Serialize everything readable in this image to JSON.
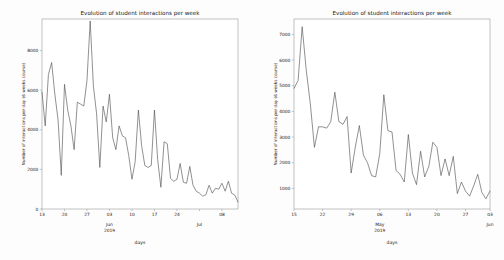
{
  "page": {
    "background": "#fdfdfd",
    "line_color": "#4d4d4d",
    "axis_color": "#9a9a9a",
    "text_color": "#1a1a1a",
    "width": 504,
    "height": 260
  },
  "figures": [
    {
      "id": "left",
      "title": "Evolution of student interactions per week",
      "xlabel": "days",
      "ylabel": "Number of interactions per day (6 weeks course)",
      "month_labels": [
        {
          "text": "Jun",
          "at": "03"
        },
        {
          "text": "2019",
          "at": "03"
        },
        {
          "text": "Jul",
          "at": "01"
        }
      ]
    },
    {
      "id": "right",
      "title": "Evolution of student interactions per week",
      "xlabel": "days",
      "ylabel": "Number of interactions per day (6 weeks course)",
      "month_labels": [
        {
          "text": "May",
          "at": "06"
        },
        {
          "text": "2019",
          "at": "06"
        },
        {
          "text": "Jun",
          "at": "03"
        }
      ]
    }
  ],
  "chart_data": [
    {
      "type": "line",
      "id": "left-chart",
      "title": "Evolution of student interactions per week",
      "xlabel": "days",
      "ylabel": "Number of interactions per day (6 weeks course)",
      "grid": false,
      "legend": null,
      "ylim": [
        0,
        9600
      ],
      "yticks": [
        0,
        2000,
        4000,
        6000,
        8000
      ],
      "ytick_labels": [
        "0",
        "2000",
        "4000",
        "6000",
        "8000"
      ],
      "xticks": [
        "13",
        "20",
        "27",
        "03",
        "10",
        "17",
        "24",
        "01",
        "08"
      ],
      "xtick_index": [
        0,
        7,
        14,
        21,
        28,
        35,
        42,
        49,
        56
      ],
      "x_start_label": "2019-05-13",
      "x_end_label": "2019-07-12",
      "values": [
        5900,
        4200,
        6800,
        7400,
        5800,
        4500,
        1700,
        6300,
        5000,
        4200,
        3000,
        5400,
        5300,
        5200,
        6500,
        9500,
        6200,
        4800,
        2100,
        5200,
        4400,
        5800,
        3600,
        3000,
        4200,
        3700,
        3600,
        2700,
        1500,
        2400,
        5000,
        3200,
        2200,
        2100,
        2200,
        5000,
        2500,
        1100,
        3400,
        3300,
        1550,
        1400,
        1500,
        2300,
        1350,
        1300,
        2150,
        1200,
        900,
        800,
        650,
        720,
        1200,
        800,
        1050,
        1000,
        1300,
        900,
        1400,
        800,
        700,
        350
      ]
    },
    {
      "type": "line",
      "id": "right-chart",
      "title": "Evolution of student interactions per week",
      "xlabel": "days",
      "ylabel": "Number of interactions per day (6 weeks course)",
      "grid": false,
      "legend": null,
      "ylim": [
        200,
        7600
      ],
      "yticks": [
        1000,
        2000,
        3000,
        4000,
        5000,
        6000,
        7000
      ],
      "ytick_labels": [
        "1000",
        "2000",
        "3000",
        "4000",
        "5000",
        "6000",
        "7000"
      ],
      "xticks": [
        "15",
        "22",
        "29",
        "06",
        "13",
        "20",
        "27",
        "03"
      ],
      "xtick_index": [
        0,
        7,
        14,
        21,
        28,
        35,
        42,
        49
      ],
      "x_start_label": "2019-04-15",
      "x_end_label": "2019-06-08",
      "values": [
        4900,
        5200,
        7300,
        5600,
        4300,
        2600,
        3400,
        3400,
        3350,
        3600,
        4750,
        3600,
        3500,
        3800,
        1600,
        2600,
        3450,
        2300,
        2000,
        1500,
        1450,
        2350,
        4650,
        3250,
        3200,
        1700,
        1550,
        1250,
        3100,
        1600,
        1150,
        2450,
        1450,
        1850,
        2800,
        2600,
        1500,
        2150,
        1500,
        2250,
        800,
        1250,
        900,
        700,
        1100,
        1550,
        850,
        600,
        900
      ]
    }
  ]
}
